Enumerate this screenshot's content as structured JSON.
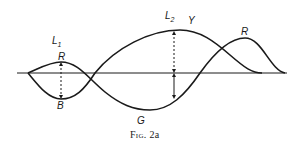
{
  "figure": {
    "caption_prefix": "Fig.",
    "caption_number": "2a",
    "labels": {
      "L1_main": "L",
      "L1_sub": "1",
      "L2_main": "L",
      "L2_sub": "2",
      "R_left": "R",
      "B": "B",
      "G": "G",
      "Y": "Y",
      "R_right": "R"
    },
    "curves": [
      {
        "name": "wave-1",
        "description": "starts at origin, rises to R, dips to G minimum, rises to R peak, returns to axis"
      },
      {
        "name": "wave-2",
        "description": "starts at origin, dips to B, rises to Y peak, returns to axis"
      }
    ],
    "markers": [
      {
        "name": "separation-arrow-L1",
        "style": "dashed",
        "between": [
          "R",
          "B"
        ]
      },
      {
        "name": "separation-arrow-L2",
        "style": "dashed+solid",
        "between": [
          "Y",
          "G-curve"
        ]
      }
    ],
    "colors": {
      "ink": "#1a1a1a",
      "background": "#ffffff"
    }
  }
}
